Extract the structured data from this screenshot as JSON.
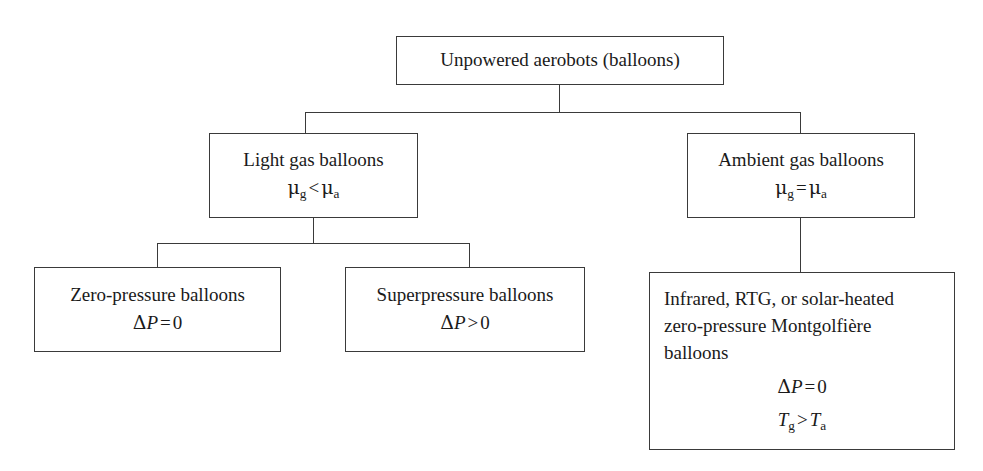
{
  "diagram": {
    "type": "tree",
    "line_color": "#3a3a3a",
    "background": "#ffffff",
    "nodes": {
      "root": {
        "id": "root",
        "label": "Unpowered aerobots (balloons)"
      },
      "light_gas": {
        "id": "light-gas-balloons",
        "label": "Light gas balloons",
        "math_symbol": "μ",
        "math_sub_left": "g",
        "math_operator": "<",
        "math_sub_right": "a"
      },
      "ambient_gas": {
        "id": "ambient-gas-balloons",
        "label": "Ambient gas balloons",
        "math_symbol": "μ",
        "math_sub_left": "g",
        "math_operator": "=",
        "math_sub_right": "a"
      },
      "zero_pressure": {
        "id": "zero-pressure-balloons",
        "label": "Zero-pressure balloons",
        "math_delta": "Δ",
        "math_var": "P",
        "math_operator": "=",
        "math_value": "0"
      },
      "superpressure": {
        "id": "superpressure-balloons",
        "label": "Superpressure balloons",
        "math_delta": "Δ",
        "math_var": "P",
        "math_operator": ">",
        "math_value": "0"
      },
      "montgolfiere": {
        "id": "montgolfiere-balloons",
        "label_line1": "Infrared, RTG, or solar-heated",
        "label_line2": "zero-pressure Montgolfière",
        "label_line3": "balloons",
        "math1_delta": "Δ",
        "math1_var": "P",
        "math1_operator": "=",
        "math1_value": "0",
        "math2_var": "T",
        "math2_sub_left": "g",
        "math2_operator": ">",
        "math2_sub_right": "a"
      }
    },
    "edges": [
      {
        "from": "root",
        "to": "light_gas"
      },
      {
        "from": "root",
        "to": "ambient_gas"
      },
      {
        "from": "light_gas",
        "to": "zero_pressure"
      },
      {
        "from": "light_gas",
        "to": "superpressure"
      },
      {
        "from": "ambient_gas",
        "to": "montgolfiere"
      }
    ]
  }
}
